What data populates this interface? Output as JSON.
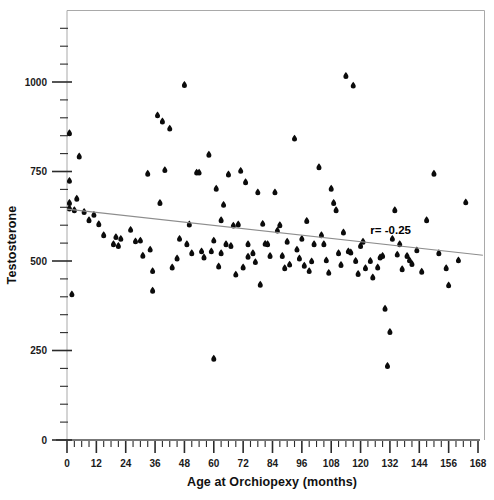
{
  "chart_data": {
    "type": "scatter",
    "title": "",
    "xlabel": "Age at Orchiopexy (months)",
    "ylabel": "Testosterone",
    "xlim": [
      0,
      168
    ],
    "ylim": [
      0,
      1150
    ],
    "grid": false,
    "legend": null,
    "x_ticks": [
      0,
      12,
      24,
      36,
      48,
      60,
      72,
      84,
      96,
      108,
      120,
      132,
      144,
      156,
      168
    ],
    "x_tick_labels": [
      "0",
      "12",
      "24",
      "36",
      "48",
      "60",
      "72",
      "84",
      "96",
      "108",
      "120",
      "132",
      "144",
      "156",
      "168"
    ],
    "x_minor_interval": 3,
    "y_ticks": [
      0,
      250,
      500,
      750,
      1000
    ],
    "y_tick_labels": [
      "0",
      "250",
      "500",
      "750",
      "1000"
    ],
    "y_minor_interval": 50,
    "annotations": [
      {
        "name": "correlation-label",
        "text": "r= -0.25",
        "x": 124,
        "y": 575
      }
    ],
    "trendline": {
      "name": "regression-line",
      "x_start": 0,
      "y_start": 645,
      "x_end": 170,
      "y_end": 516,
      "correlation": -0.25
    },
    "points": [
      [
        1,
        855
      ],
      [
        1,
        722
      ],
      [
        1,
        660
      ],
      [
        1,
        645
      ],
      [
        2,
        405
      ],
      [
        3,
        640
      ],
      [
        4,
        672
      ],
      [
        5,
        790
      ],
      [
        7,
        635
      ],
      [
        9,
        612
      ],
      [
        11,
        627
      ],
      [
        13,
        601
      ],
      [
        15,
        570
      ],
      [
        19,
        545
      ],
      [
        20,
        565
      ],
      [
        21,
        540
      ],
      [
        22,
        560
      ],
      [
        26,
        585
      ],
      [
        28,
        553
      ],
      [
        30,
        555
      ],
      [
        31,
        513
      ],
      [
        33,
        742
      ],
      [
        34,
        530
      ],
      [
        35,
        470
      ],
      [
        35,
        415
      ],
      [
        37,
        905
      ],
      [
        38,
        660
      ],
      [
        39,
        888
      ],
      [
        40,
        752
      ],
      [
        42,
        868
      ],
      [
        43,
        480
      ],
      [
        45,
        505
      ],
      [
        46,
        560
      ],
      [
        48,
        990
      ],
      [
        49,
        545
      ],
      [
        50,
        600
      ],
      [
        51,
        520
      ],
      [
        53,
        745
      ],
      [
        54,
        745
      ],
      [
        55,
        525
      ],
      [
        56,
        508
      ],
      [
        58,
        795
      ],
      [
        59,
        525
      ],
      [
        60,
        225
      ],
      [
        60,
        555
      ],
      [
        61,
        700
      ],
      [
        62,
        483
      ],
      [
        63,
        612
      ],
      [
        63,
        520
      ],
      [
        64,
        655
      ],
      [
        65,
        545
      ],
      [
        66,
        740
      ],
      [
        67,
        540
      ],
      [
        68,
        597
      ],
      [
        69,
        460
      ],
      [
        70,
        600
      ],
      [
        71,
        750
      ],
      [
        72,
        480
      ],
      [
        73,
        718
      ],
      [
        74,
        545
      ],
      [
        74,
        510
      ],
      [
        76,
        520
      ],
      [
        77,
        495
      ],
      [
        78,
        690
      ],
      [
        79,
        432
      ],
      [
        80,
        602
      ],
      [
        81,
        546
      ],
      [
        82,
        545
      ],
      [
        83,
        512
      ],
      [
        85,
        690
      ],
      [
        86,
        583
      ],
      [
        87,
        598
      ],
      [
        88,
        512
      ],
      [
        89,
        478
      ],
      [
        90,
        552
      ],
      [
        91,
        488
      ],
      [
        93,
        840
      ],
      [
        94,
        530
      ],
      [
        95,
        505
      ],
      [
        96,
        560
      ],
      [
        97,
        485
      ],
      [
        98,
        610
      ],
      [
        99,
        470
      ],
      [
        100,
        497
      ],
      [
        101,
        545
      ],
      [
        103,
        760
      ],
      [
        104,
        570
      ],
      [
        105,
        545
      ],
      [
        106,
        500
      ],
      [
        107,
        465
      ],
      [
        108,
        700
      ],
      [
        109,
        660
      ],
      [
        110,
        640
      ],
      [
        111,
        520
      ],
      [
        112,
        487
      ],
      [
        113,
        578
      ],
      [
        114,
        1015
      ],
      [
        115,
        525
      ],
      [
        116,
        522
      ],
      [
        117,
        988
      ],
      [
        118,
        498
      ],
      [
        119,
        462
      ],
      [
        120,
        540
      ],
      [
        121,
        552
      ],
      [
        122,
        478
      ],
      [
        124,
        498
      ],
      [
        125,
        452
      ],
      [
        127,
        480
      ],
      [
        128,
        508
      ],
      [
        129,
        512
      ],
      [
        130,
        365
      ],
      [
        131,
        205
      ],
      [
        132,
        300
      ],
      [
        133,
        560
      ],
      [
        134,
        640
      ],
      [
        135,
        516
      ],
      [
        136,
        545
      ],
      [
        137,
        475
      ],
      [
        139,
        512
      ],
      [
        140,
        500
      ],
      [
        141,
        490
      ],
      [
        143,
        528
      ],
      [
        145,
        468
      ],
      [
        147,
        612
      ],
      [
        150,
        742
      ],
      [
        152,
        520
      ],
      [
        155,
        478
      ],
      [
        156,
        430
      ],
      [
        160,
        500
      ],
      [
        163,
        662
      ]
    ]
  },
  "figure": {
    "background_color": "#ffffff",
    "point_color": "#0b0b0b",
    "trendline_color": "#8d8d8d",
    "frame_color": "#a9a9a9"
  }
}
